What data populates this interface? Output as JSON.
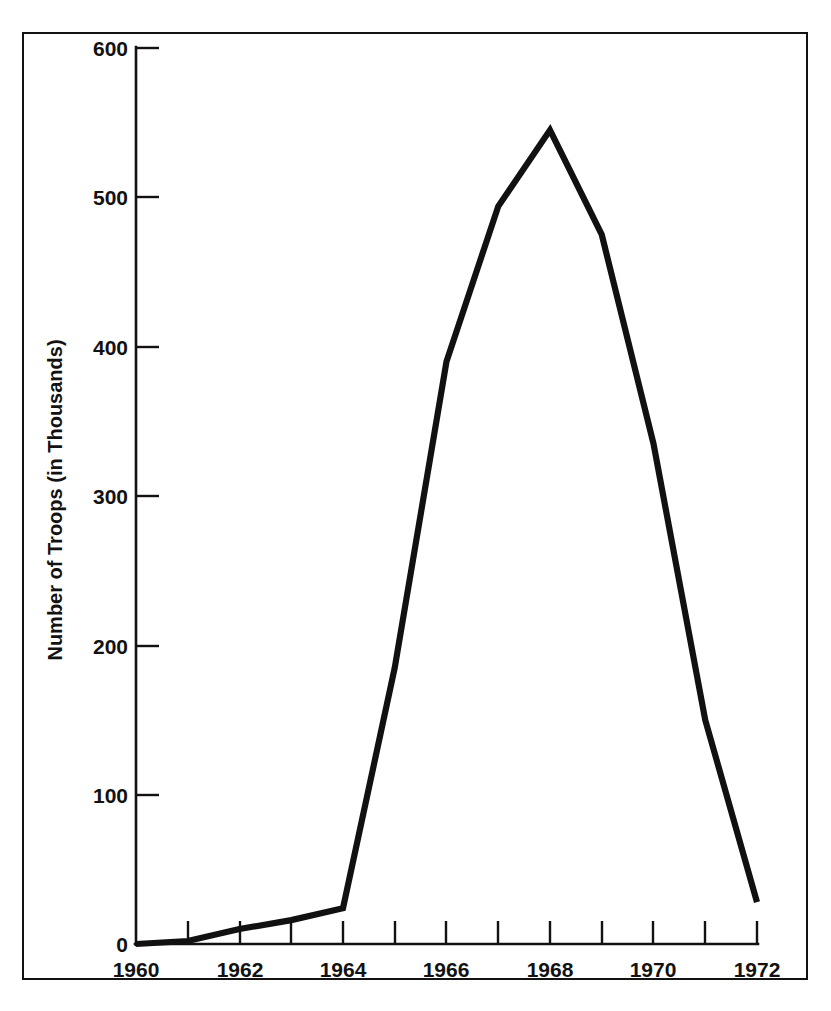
{
  "chart_data": {
    "type": "line",
    "title": "",
    "xlabel": "",
    "ylabel": "Number of Troops (in Thousands)",
    "x": [
      1960,
      1961,
      1962,
      1963,
      1964,
      1965,
      1966,
      1967,
      1968,
      1969,
      1970,
      1971,
      1972
    ],
    "values": [
      0,
      2,
      10,
      16,
      24,
      185,
      390,
      494,
      545,
      475,
      335,
      150,
      28
    ],
    "series": [
      {
        "name": "U.S. Troops in Vietnam",
        "values": [
          0,
          2,
          10,
          16,
          24,
          185,
          390,
          494,
          545,
          475,
          335,
          150,
          28
        ]
      }
    ],
    "xlim": [
      1960,
      1972
    ],
    "ylim": [
      0,
      600
    ],
    "xticks": [
      1960,
      1961,
      1962,
      1963,
      1964,
      1965,
      1966,
      1967,
      1968,
      1969,
      1970,
      1971,
      1972
    ],
    "xtick_labels": [
      "1960",
      "",
      "1962",
      "",
      "1964",
      "",
      "1966",
      "",
      "1968",
      "",
      "1970",
      "",
      "1972"
    ],
    "yticks": [
      0,
      100,
      200,
      300,
      400,
      500,
      600
    ],
    "ytick_labels": [
      "0",
      "100",
      "200",
      "300",
      "400",
      "500",
      "600"
    ],
    "grid": false,
    "legend": false,
    "line_color": "#111111",
    "axis_color": "#121212",
    "background_color": "#ffffff"
  },
  "axes": {
    "y_axis_title": "Number of Troops (in Thousands)",
    "x_axis_title": ""
  },
  "frame": {
    "border_color": "#121212"
  }
}
